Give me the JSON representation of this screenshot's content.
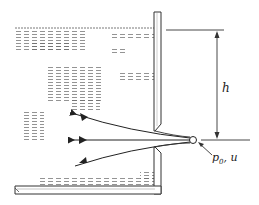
{
  "diagram": {
    "labels": {
      "height": "h",
      "pressure_symbol": "p",
      "pressure_subscript": "0",
      "separator": ", ",
      "velocity": "u"
    },
    "elements": {
      "tank": "water tank with free surface",
      "wall": "vertical tank wall with sharp-edged orifice",
      "jet": "issuing jet contracting to vena contracta",
      "streamlines": 3,
      "measurement_point": "small circle at vena contracta",
      "dimension": "vertical arrow from free surface down to jet centerline"
    },
    "colors": {
      "stroke": "#333333",
      "fill": "#ffffff",
      "water_hatch": "#555555"
    }
  }
}
